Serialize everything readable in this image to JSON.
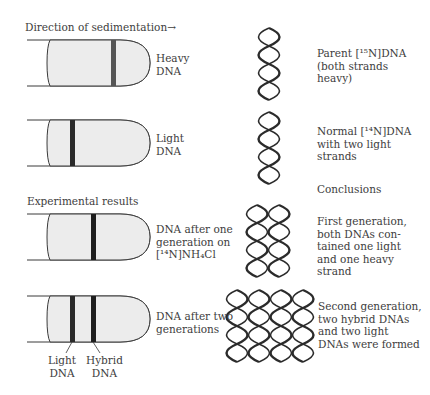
{
  "direction_label": "Direction of sedimentation→",
  "section_labels": {
    "experimental": "Experimental results",
    "conclusions": "Conclusions"
  },
  "tubes": [
    {
      "label": "Heavy\nDNA",
      "bands": [
        {
          "position": "heavy",
          "color": "#555555"
        }
      ]
    },
    {
      "label": "Light\nDNA",
      "bands": [
        {
          "position": "light",
          "color": "#2a2a2a"
        }
      ]
    },
    {
      "label": "DNA after one\ngeneration on\n[¹⁴N]NH₄Cl",
      "bands": [
        {
          "position": "hybrid",
          "color": "#1e1e1e"
        }
      ]
    },
    {
      "label": "DNA after two\ngenerations",
      "bands": [
        {
          "position": "light",
          "color": "#2a2a2a"
        },
        {
          "position": "hybrid",
          "color": "#1e1e1e"
        }
      ]
    }
  ],
  "band_callouts": {
    "light": "Light\nDNA",
    "hybrid": "Hybrid\nDNA"
  },
  "helix_descriptions": [
    {
      "count": 1,
      "text": "Parent [¹⁵N]DNA\n(both strands\nheavy)"
    },
    {
      "count": 1,
      "text": "Normal [¹⁴N]DNA\nwith two light\nstrands"
    },
    {
      "count": 2,
      "text": "First generation,\nboth DNAs con-\ntained one light\nand one heavy\nstrand"
    },
    {
      "count": 4,
      "text": "Second generation,\ntwo hybrid DNAs\nand two light\nDNAs were formed"
    }
  ],
  "colors": {
    "tube_fill": "#ececec",
    "tube_stroke": "#3a3a3a",
    "helix_stroke": "#2b2b2b",
    "text": "#3d3d3d"
  }
}
